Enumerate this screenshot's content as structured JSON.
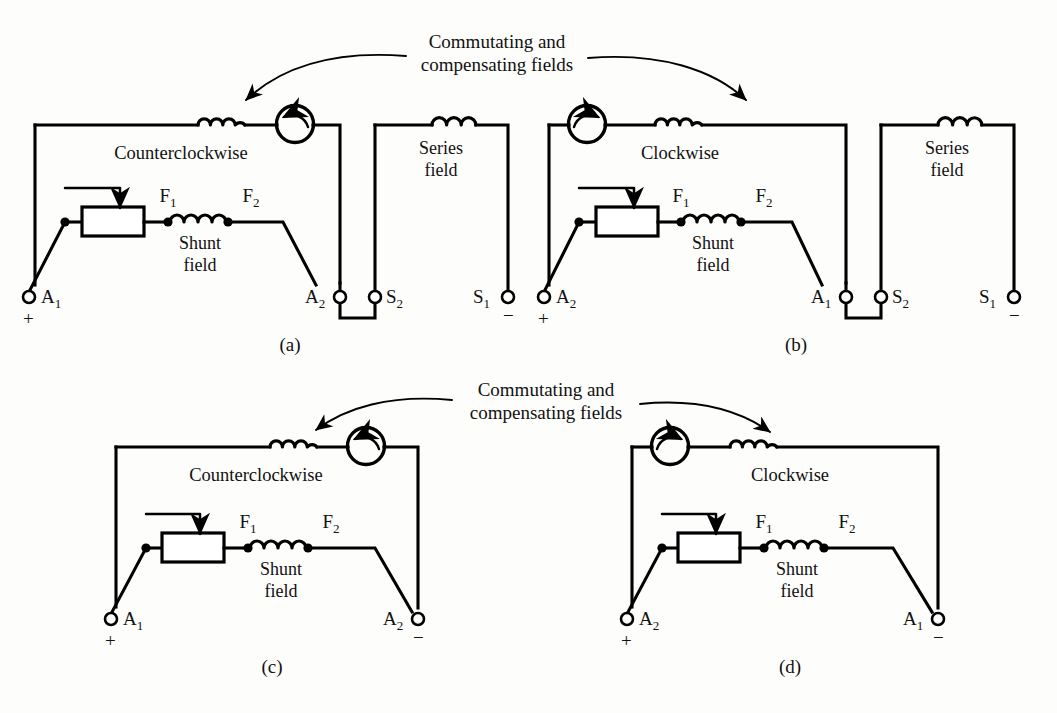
{
  "figure": {
    "background_color": "#fdfdfc",
    "line_color": "#000000"
  },
  "callouts": [
    {
      "id": "callout-top",
      "line1": "Commutating and",
      "line2": "compensating fields"
    },
    {
      "id": "callout-bottom",
      "line1": "Commutating and",
      "line2": "compensating fields"
    }
  ],
  "panels": [
    {
      "key": "a",
      "caption": "(a)",
      "rotation_label": "Counterclockwise",
      "rotation_direction": "counterclockwise",
      "machine_arrow_icon": "rotation-arrow-ccw-icon",
      "shunt_field_label_line1": "Shunt",
      "shunt_field_label_line2": "field",
      "series_field_label_line1": "Series",
      "series_field_label_line2": "field",
      "field_terminals": {
        "f1": "F",
        "f1_sub": "1",
        "f2": "F",
        "f2_sub": "2"
      },
      "terminals": [
        {
          "name": "A",
          "sub": "1",
          "sign": "+",
          "label_side": "right"
        },
        {
          "name": "A",
          "sub": "2",
          "sign": "",
          "label_side": "left"
        },
        {
          "name": "S",
          "sub": "2",
          "sign": "",
          "label_side": "right"
        },
        {
          "name": "S",
          "sub": "1",
          "sign": "−",
          "label_side": "left"
        }
      ],
      "has_series_field": true
    },
    {
      "key": "b",
      "caption": "(b)",
      "rotation_label": "Clockwise",
      "rotation_direction": "clockwise",
      "machine_arrow_icon": "rotation-arrow-cw-icon",
      "shunt_field_label_line1": "Shunt",
      "shunt_field_label_line2": "field",
      "series_field_label_line1": "Series",
      "series_field_label_line2": "field",
      "field_terminals": {
        "f1": "F",
        "f1_sub": "1",
        "f2": "F",
        "f2_sub": "2"
      },
      "terminals": [
        {
          "name": "A",
          "sub": "2",
          "sign": "+",
          "label_side": "right"
        },
        {
          "name": "A",
          "sub": "1",
          "sign": "",
          "label_side": "left"
        },
        {
          "name": "S",
          "sub": "2",
          "sign": "",
          "label_side": "right"
        },
        {
          "name": "S",
          "sub": "1",
          "sign": "−",
          "label_side": "left"
        }
      ],
      "has_series_field": true
    },
    {
      "key": "c",
      "caption": "(c)",
      "rotation_label": "Counterclockwise",
      "rotation_direction": "counterclockwise",
      "machine_arrow_icon": "rotation-arrow-ccw-icon",
      "shunt_field_label_line1": "Shunt",
      "shunt_field_label_line2": "field",
      "field_terminals": {
        "f1": "F",
        "f1_sub": "1",
        "f2": "F",
        "f2_sub": "2"
      },
      "terminals": [
        {
          "name": "A",
          "sub": "1",
          "sign": "+",
          "label_side": "right"
        },
        {
          "name": "A",
          "sub": "2",
          "sign": "−",
          "label_side": "left"
        }
      ],
      "has_series_field": false
    },
    {
      "key": "d",
      "caption": "(d)",
      "rotation_label": "Clockwise",
      "rotation_direction": "clockwise",
      "machine_arrow_icon": "rotation-arrow-cw-icon",
      "shunt_field_label_line1": "Shunt",
      "shunt_field_label_line2": "field",
      "field_terminals": {
        "f1": "F",
        "f1_sub": "1",
        "f2": "F",
        "f2_sub": "2"
      },
      "terminals": [
        {
          "name": "A",
          "sub": "2",
          "sign": "+",
          "label_side": "right"
        },
        {
          "name": "A",
          "sub": "1",
          "sign": "−",
          "label_side": "left"
        }
      ],
      "has_series_field": false
    }
  ],
  "labels": {
    "panel_a": {
      "rotation": "Counterclockwise",
      "caption": "(a)",
      "f1": "F",
      "f1sub": "1",
      "f2": "F",
      "f2sub": "2",
      "shunt1": "Shunt",
      "shunt2": "field",
      "series1": "Series",
      "series2": "field",
      "t1": "A",
      "t1sub": "1",
      "t1sign": "+",
      "t2": "A",
      "t2sub": "2",
      "t3": "S",
      "t3sub": "2",
      "t4": "S",
      "t4sub": "1",
      "t4sign": "−"
    },
    "panel_b": {
      "rotation": "Clockwise",
      "caption": "(b)",
      "f1": "F",
      "f1sub": "1",
      "f2": "F",
      "f2sub": "2",
      "shunt1": "Shunt",
      "shunt2": "field",
      "series1": "Series",
      "series2": "field",
      "t1": "A",
      "t1sub": "2",
      "t1sign": "+",
      "t2": "A",
      "t2sub": "1",
      "t3": "S",
      "t3sub": "2",
      "t4": "S",
      "t4sub": "1",
      "t4sign": "−"
    },
    "panel_c": {
      "rotation": "Counterclockwise",
      "caption": "(c)",
      "f1": "F",
      "f1sub": "1",
      "f2": "F",
      "f2sub": "2",
      "shunt1": "Shunt",
      "shunt2": "field",
      "t1": "A",
      "t1sub": "1",
      "t1sign": "+",
      "t2": "A",
      "t2sub": "2",
      "t2sign": "−"
    },
    "panel_d": {
      "rotation": "Clockwise",
      "caption": "(d)",
      "f1": "F",
      "f1sub": "1",
      "f2": "F",
      "f2sub": "2",
      "shunt1": "Shunt",
      "shunt2": "field",
      "t1": "A",
      "t1sub": "2",
      "t1sign": "+",
      "t2": "A",
      "t2sub": "1",
      "t2sign": "−"
    },
    "callout_top1": "Commutating and",
    "callout_top2": "compensating fields",
    "callout_bot1": "Commutating and",
    "callout_bot2": "compensating fields"
  }
}
